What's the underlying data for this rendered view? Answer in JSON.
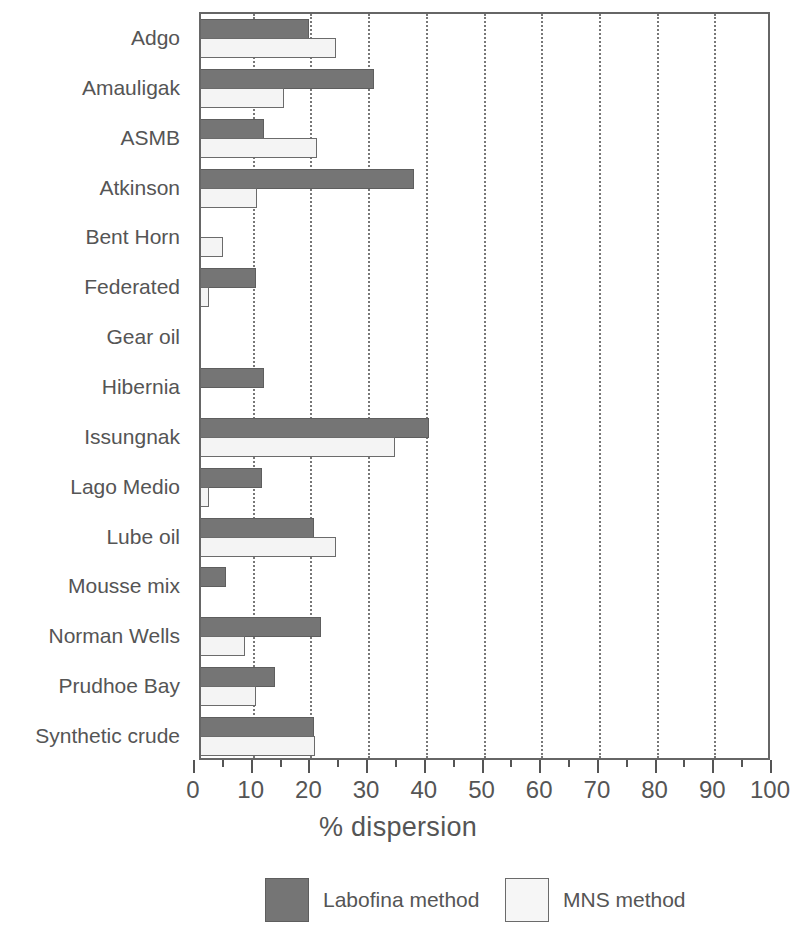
{
  "chart_data": {
    "type": "bar",
    "orientation": "horizontal",
    "title": "",
    "xlabel": "% dispersion",
    "ylabel": "",
    "xlim": [
      0,
      100
    ],
    "ylim": null,
    "grid": "vertical dotted gridlines at every 10 units",
    "legend_position": "bottom-center",
    "xticks": [
      0,
      10,
      20,
      30,
      40,
      50,
      60,
      70,
      80,
      90,
      100
    ],
    "xticklabels": [
      "0",
      "10",
      "20",
      "30",
      "40",
      "50",
      "60",
      "70",
      "80",
      "90",
      "100"
    ],
    "minor_ticks_interval": 5,
    "categories": [
      "Adgo",
      "Amauligak",
      "ASMB",
      "Atkinson",
      "Bent Horn",
      "Federated",
      "Gear oil",
      "Hibernia",
      "Issungnak",
      "Lago Medio",
      "Lube oil",
      "Mousse mix",
      "Norman Wells",
      "Prudhoe Bay",
      "Synthetic crude"
    ],
    "series": [
      {
        "name": "Labofina method",
        "color": "#757575",
        "values": [
          19.7,
          31.0,
          12.0,
          38.0,
          0.0,
          10.6,
          0.0,
          12.0,
          40.6,
          11.6,
          20.7,
          5.4,
          21.9,
          13.8,
          20.6
        ]
      },
      {
        "name": "MNS method",
        "color": "#f4f4f4",
        "values": [
          24.4,
          15.5,
          21.1,
          10.7,
          4.9,
          2.4,
          0.0,
          0.0,
          34.7,
          2.4,
          24.4,
          0.0,
          8.7,
          10.6,
          20.8
        ]
      }
    ]
  },
  "legend": {
    "entries": [
      {
        "label": "Labofina method",
        "swatch": "dark"
      },
      {
        "label": "MNS method",
        "swatch": "light"
      }
    ]
  },
  "axis": {
    "x_title": "% dispersion"
  }
}
